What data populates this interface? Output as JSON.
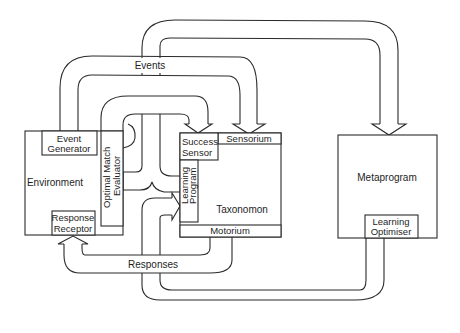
{
  "diagram": {
    "type": "block-flow",
    "nodes": {
      "environment": "Environment",
      "event_generator": [
        "Event",
        "Generator"
      ],
      "response_receptor": [
        "Response",
        "Receptor"
      ],
      "optimal_match_evaluator": [
        "Optimal Match",
        "Evaluator"
      ],
      "success_sensor": [
        "Success",
        "Sensor"
      ],
      "sensorium": "Sensorium",
      "learning_program": [
        "Learning",
        "Program"
      ],
      "taxonomon": "Taxonomon",
      "motorium": "Motorium",
      "metaprogram": "Metaprogram",
      "learning_optimiser": [
        "Learning",
        "Optimiser"
      ]
    },
    "flows": {
      "events": "Events",
      "responses": "Responses"
    },
    "colors": {
      "stroke": "#2a2a2a",
      "background": "#ffffff",
      "text": "#1e1e1e"
    }
  }
}
